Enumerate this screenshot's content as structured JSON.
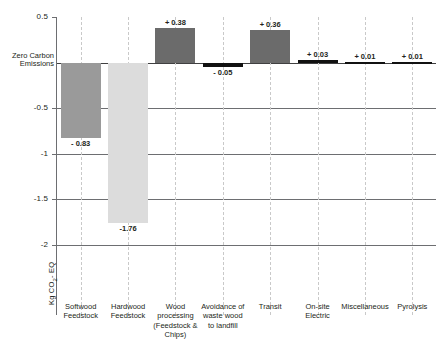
{
  "chart_data": {
    "type": "bar",
    "title": "",
    "xlabel": "",
    "ylabel": "Kg CO2- EQ",
    "ylabel_prefix": "Kg CO",
    "ylabel_sub": "2",
    "ylabel_suffix": "- EQ",
    "zero_label_line1": "Zero Carbon",
    "zero_label_line2": "Emissions",
    "ylim": [
      -2.25,
      0.5
    ],
    "yticks": [
      0.5,
      0,
      -0.5,
      -1,
      -1.5,
      -2
    ],
    "ytick_labels": [
      "0.5",
      "0",
      "-0.5",
      "-1",
      "-1.5",
      "-2"
    ],
    "grid": "horizontal-solid-vertical-dashed",
    "legend": "none",
    "categories": [
      "Softwood Feedstock",
      "Hardwood Feedstock",
      "Wood processing (Feedstock & Chips)",
      "Avoidance of waste wood to landfill",
      "Transit",
      "On-site Electric",
      "Miscellaneous",
      "Pyrolysis"
    ],
    "category_lines": [
      [
        "Softwood",
        "Feedstock"
      ],
      [
        "Hardwood",
        "Feedstock"
      ],
      [
        "Wood",
        "processing",
        "(Feedstock &",
        "Chips)"
      ],
      [
        "Avoidance of",
        "waste wood",
        "to landfill"
      ],
      [
        "Transit"
      ],
      [
        "On-site",
        "Electric"
      ],
      [
        "Miscellaneous"
      ],
      [
        "Pyrolysis"
      ]
    ],
    "values": [
      -0.83,
      -1.76,
      0.38,
      -0.05,
      0.36,
      0.03,
      0.01,
      0.01
    ],
    "value_labels": [
      "- 0.83",
      "-1.76",
      "+ 0.38",
      "- 0.05",
      "+ 0.36",
      "+ 0.03",
      "+ 0.01",
      "+ 0.01"
    ],
    "bar_colors": [
      "#9a9a9a",
      "#dcdcdc",
      "#6b6b6b",
      "#111111",
      "#6b6b6b",
      "#111111",
      "#111111",
      "#111111"
    ]
  }
}
